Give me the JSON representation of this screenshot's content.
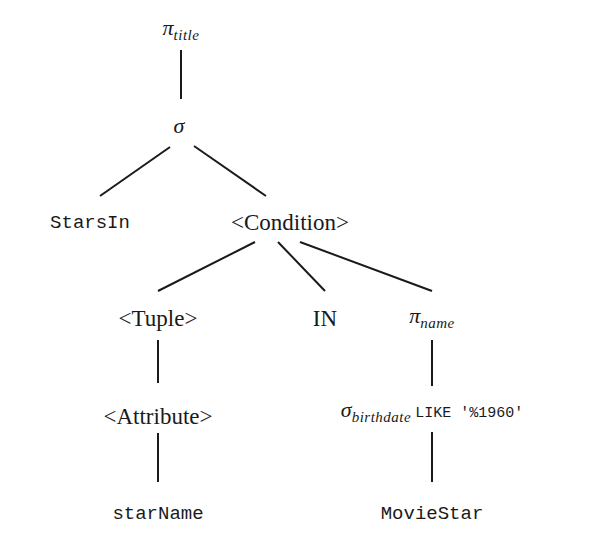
{
  "diagram": {
    "type": "parse-tree",
    "nodes": {
      "root": {
        "symbol": "π",
        "subscript": "title"
      },
      "select": {
        "symbol": "σ"
      },
      "starsin": {
        "label": "StarsIn"
      },
      "condition": {
        "label": "<Condition>"
      },
      "tuple": {
        "label": "<Tuple>"
      },
      "in": {
        "label": "IN"
      },
      "project_name": {
        "symbol": "π",
        "subscript": "name"
      },
      "attribute": {
        "label": "<Attribute>"
      },
      "select_birthdate": {
        "symbol": "σ",
        "subscript": "birthdate",
        "condition": "LIKE '%1960'"
      },
      "starname": {
        "label": "starName"
      },
      "moviestar": {
        "label": "MovieStar"
      }
    },
    "edges": [
      [
        "root",
        "select"
      ],
      [
        "select",
        "starsin"
      ],
      [
        "select",
        "condition"
      ],
      [
        "condition",
        "tuple"
      ],
      [
        "condition",
        "in"
      ],
      [
        "condition",
        "project_name"
      ],
      [
        "tuple",
        "attribute"
      ],
      [
        "attribute",
        "starname"
      ],
      [
        "project_name",
        "select_birthdate"
      ],
      [
        "select_birthdate",
        "moviestar"
      ]
    ],
    "colors": {
      "line": "#1a1a1a",
      "text": "#1a1a1a",
      "background": "#ffffff"
    }
  }
}
